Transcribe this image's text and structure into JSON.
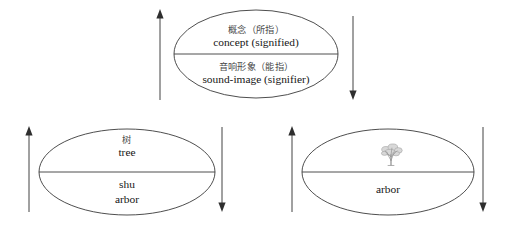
{
  "diagram": {
    "stroke_color": "#3a3a3a",
    "arrow_color": "#2e2e2e",
    "cjk_text_color": "#4a4a4a",
    "latin_text_color": "#161616",
    "background_color": "#ffffff"
  },
  "ellipses": [
    {
      "id": "sign-general",
      "name": "general-sign-ellipse",
      "top": {
        "cn": "概念（所指）",
        "en": "concept (signified)"
      },
      "bottom": {
        "cn": "音响形象（能指）",
        "en": "sound-image (signifier)"
      },
      "left_arrow": {
        "direction": "up",
        "name": "left-up-arrow"
      },
      "right_arrow": {
        "direction": "down",
        "name": "right-down-arrow"
      }
    },
    {
      "id": "sign-tree-chinese",
      "name": "tree-chinese-ellipse",
      "top": {
        "cn": "树",
        "en": "tree"
      },
      "bottom": {
        "cn": "",
        "en_line1": "shu",
        "en_line2": "arbor"
      },
      "left_arrow": {
        "direction": "up",
        "name": "left-up-arrow"
      },
      "right_arrow": {
        "direction": "down",
        "name": "right-down-arrow"
      }
    },
    {
      "id": "sign-tree-latin",
      "name": "tree-latin-ellipse",
      "top": {
        "image": "tree-sketch-icon",
        "cn": "",
        "en": ""
      },
      "bottom": {
        "cn": "",
        "en": "arbor"
      },
      "left_arrow": {
        "direction": "up",
        "name": "left-up-arrow"
      },
      "right_arrow": {
        "direction": "down",
        "name": "right-down-arrow"
      }
    }
  ]
}
